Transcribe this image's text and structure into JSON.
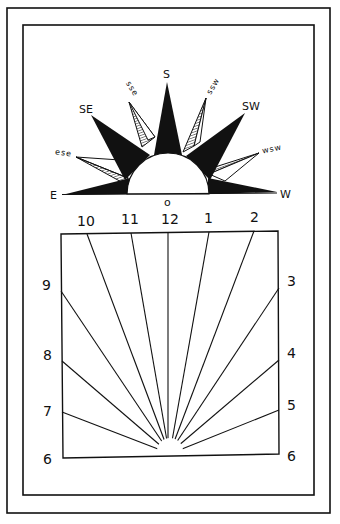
{
  "figure": {
    "type": "horizontal-sundial-diagram",
    "colors": {
      "ink": "#111111",
      "paper": "#ffffff"
    }
  },
  "compass_rose": {
    "center_marker": "o",
    "points": [
      {
        "label": "E",
        "style": "solid"
      },
      {
        "label": "ese",
        "style": "hatched"
      },
      {
        "label": "SE",
        "style": "solid"
      },
      {
        "label": "sse",
        "style": "hatched"
      },
      {
        "label": "S",
        "style": "solid"
      },
      {
        "label": "ssw",
        "style": "hatched"
      },
      {
        "label": "SW",
        "style": "solid"
      },
      {
        "label": "wsw",
        "style": "hatched"
      },
      {
        "label": "W",
        "style": "solid"
      }
    ]
  },
  "dial": {
    "top_hours": [
      "10",
      "11",
      "12",
      "1",
      "2"
    ],
    "left_hours": [
      "9",
      "8",
      "7",
      "6"
    ],
    "right_hours": [
      "3",
      "4",
      "5",
      "6"
    ]
  }
}
